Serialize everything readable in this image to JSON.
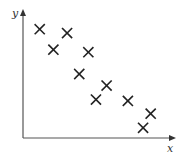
{
  "chart_data": {
    "type": "scatter",
    "title": "",
    "xlabel": "x",
    "ylabel": "y",
    "marker": "x",
    "grid": false,
    "legend": null,
    "xlim": [
      0,
      10
    ],
    "ylim": [
      0,
      10
    ],
    "x_ticks": [],
    "y_ticks": [],
    "points": [
      {
        "x": 1.1,
        "y": 8.5
      },
      {
        "x": 2.0,
        "y": 6.9
      },
      {
        "x": 2.9,
        "y": 8.2
      },
      {
        "x": 4.3,
        "y": 6.7
      },
      {
        "x": 3.7,
        "y": 5.0
      },
      {
        "x": 5.5,
        "y": 4.1
      },
      {
        "x": 4.8,
        "y": 3.0
      },
      {
        "x": 6.9,
        "y": 2.9
      },
      {
        "x": 8.4,
        "y": 1.9
      },
      {
        "x": 7.9,
        "y": 0.8
      }
    ],
    "colors": {
      "marker": "#222222",
      "axis": "#555555",
      "label": "#333333"
    }
  },
  "axes": {
    "x_label": "x",
    "y_label": "y"
  }
}
